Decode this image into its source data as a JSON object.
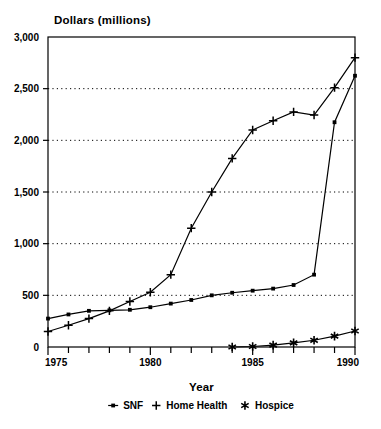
{
  "chart_data": {
    "type": "line",
    "title": "Dollars (millions)",
    "xlabel": "Year",
    "ylabel": "",
    "xlim": [
      1975,
      1990
    ],
    "ylim": [
      0,
      3000
    ],
    "grid": "horizontal-dotted",
    "legend_position": "bottom",
    "x": [
      1975,
      1976,
      1977,
      1978,
      1979,
      1980,
      1981,
      1982,
      1983,
      1984,
      1985,
      1986,
      1987,
      1988,
      1989,
      1990
    ],
    "xticks": [
      "1975",
      "",
      "",
      "",
      "",
      "1980",
      "",
      "",
      "",
      "",
      "1985",
      "",
      "",
      "",
      "",
      "1990"
    ],
    "xtick_labels": [
      "1975",
      "1980",
      "1985",
      "1990"
    ],
    "yticks": [
      0,
      500,
      1000,
      1500,
      2000,
      2500,
      3000
    ],
    "ytick_labels": [
      "0",
      "500",
      "1,000",
      "1,500",
      "2,000",
      "2,500",
      "3,000"
    ],
    "series": [
      {
        "name": "SNF",
        "marker": "square",
        "marker_icon": "square-marker-icon",
        "color": "#000000",
        "values": [
          275,
          315,
          350,
          355,
          360,
          385,
          420,
          455,
          500,
          525,
          545,
          565,
          600,
          700,
          2175,
          2625
        ]
      },
      {
        "name": "Home Health",
        "marker": "plus",
        "marker_icon": "plus-marker-icon",
        "color": "#000000",
        "values": [
          150,
          210,
          275,
          350,
          440,
          530,
          700,
          1150,
          1500,
          1825,
          2100,
          2190,
          2275,
          2245,
          2510,
          2800
        ]
      },
      {
        "name": "Hospice",
        "marker": "asterisk",
        "marker_icon": "asterisk-marker-icon",
        "color": "#000000",
        "values": [
          null,
          null,
          null,
          null,
          null,
          null,
          null,
          null,
          null,
          0,
          5,
          18,
          40,
          65,
          105,
          155
        ]
      }
    ]
  },
  "legend": {
    "items": [
      {
        "label": "SNF",
        "marker": "square-marker-icon"
      },
      {
        "label": "Home Health",
        "marker": "plus-marker-icon"
      },
      {
        "label": "Hospice",
        "marker": "asterisk-marker-icon"
      }
    ]
  },
  "colors": {
    "axis": "#000000",
    "grid": "#000000",
    "background": "#ffffff",
    "ink": "#000000"
  }
}
